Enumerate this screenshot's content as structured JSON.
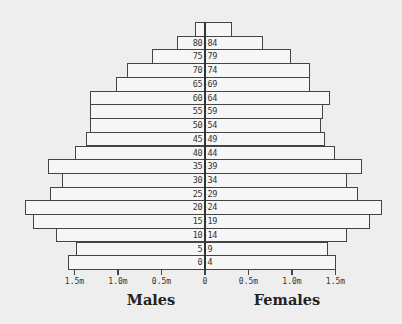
{
  "chart_data": {
    "type": "bar",
    "subtype": "population-pyramid",
    "title": "",
    "categories": [
      "85+",
      "80-84",
      "75-79",
      "70-74",
      "65-69",
      "60-64",
      "55-59",
      "50-54",
      "45-49",
      "40-44",
      "35-39",
      "30-34",
      "25-29",
      "20-24",
      "15-19",
      "10-14",
      "5-9",
      "0-4"
    ],
    "category_labels_shown": [
      "",
      "80-84",
      "75-79",
      "70-74",
      "65-69",
      "60-64",
      "55-59",
      "50-54",
      "45-49",
      "40-44",
      "35-39",
      "30-34",
      "25-29",
      "20-24",
      "15-19",
      "10-14",
      "5-9",
      "0-4"
    ],
    "series": [
      {
        "name": "Males",
        "side": "left",
        "values": [
          0.11,
          0.32,
          0.61,
          0.9,
          1.02,
          1.32,
          1.32,
          1.32,
          1.37,
          1.5,
          1.8,
          1.64,
          1.78,
          2.07,
          1.98,
          1.71,
          1.48,
          1.58
        ]
      },
      {
        "name": "Females",
        "side": "right",
        "values": [
          0.31,
          0.67,
          0.99,
          1.21,
          1.21,
          1.44,
          1.36,
          1.33,
          1.38,
          1.49,
          1.81,
          1.63,
          1.76,
          2.03,
          1.9,
          1.63,
          1.42,
          1.51
        ]
      }
    ],
    "units": "millions",
    "xlabel_left": "Males",
    "xlabel_right": "Females",
    "ylabel": "",
    "x_ticks": [
      {
        "value": -1.5,
        "label": "1.5m"
      },
      {
        "value": -1.0,
        "label": "1.0m"
      },
      {
        "value": -0.5,
        "label": "0.5m"
      },
      {
        "value": 0,
        "label": "0"
      },
      {
        "value": 0.5,
        "label": "0.5m"
      },
      {
        "value": 1.0,
        "label": "1.0m"
      },
      {
        "value": 1.5,
        "label": "1.5m"
      }
    ],
    "xlim": [
      -2.07,
      2.03
    ],
    "grid": false,
    "legend": "none",
    "colors": {
      "background": "#eeeeee",
      "bar_fill": "#f6f6f6",
      "bar_border": "#444444"
    }
  },
  "labels": {
    "males": "Males",
    "females": "Females"
  }
}
